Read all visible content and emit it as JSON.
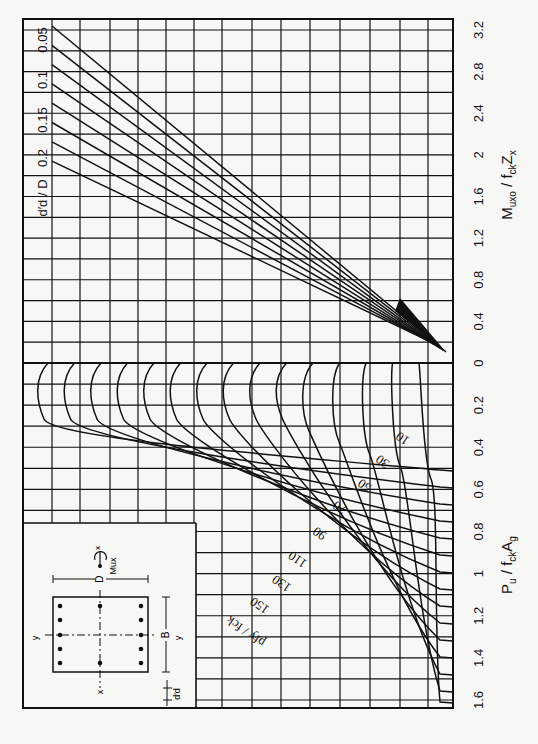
{
  "chart_data": {
    "type": "line",
    "orientation": "rotated-90-clockwise",
    "panels": [
      {
        "name": "upper",
        "axis_label": "Muxo / fck Zx",
        "axis_label_parts": {
          "main": "M",
          "sub1": "uxo",
          "mid": " / f",
          "sub2": "ck",
          "end": "Z",
          "sub3": "x"
        },
        "ticks": [
          "0",
          "0.4",
          "0.8",
          "1.2",
          "1.6",
          "2",
          "2.4",
          "2.8",
          "3.2"
        ],
        "range": [
          0,
          3.2
        ],
        "family_label": "d'd / D",
        "family_values": [
          "0.05",
          "0.1",
          "0.15",
          "0.2"
        ],
        "note": "straight lines fanning from near origin, one line per d'/D value and steel ratio"
      },
      {
        "name": "lower",
        "axis_label": "Pu / fck Ag",
        "axis_label_parts": {
          "main": "P",
          "sub1": "u",
          "mid": " / f",
          "sub2": "ck",
          "end": "A",
          "sub3": "g"
        },
        "ticks": [
          "0",
          "0.2",
          "0.4",
          "0.6",
          "0.8",
          "1",
          "1.2",
          "1.4",
          "1.6"
        ],
        "range": [
          0,
          1.6
        ],
        "family_label": "pfy / fck",
        "family_values": [
          "10",
          "30",
          "50",
          "70",
          "90",
          "110",
          "130",
          "150"
        ],
        "curve_count": 15
      }
    ],
    "grid": true,
    "legend": "none"
  },
  "labels": {
    "upper_axis": {
      "main": "M",
      "sub1": "uxo",
      "mid": " / f",
      "sub2": "ck",
      "end": "Z",
      "sub3": "x"
    },
    "lower_axis": {
      "main": "P",
      "sub1": "u",
      "mid": " / f",
      "sub2": "ck",
      "end": "A",
      "sub3": "g"
    },
    "dd_label": "d′d / D",
    "pf_label": "pfy / fck",
    "inset": {
      "D": "D",
      "B": "B",
      "x": "x",
      "y": "y",
      "Mux": "Mux",
      "dd": "d′d"
    }
  },
  "colors": {
    "ink": "#111111",
    "paper": "#f7f7f5"
  }
}
